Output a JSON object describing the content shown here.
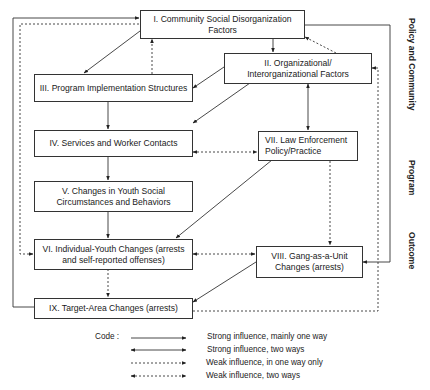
{
  "diagram": {
    "boxes": {
      "I": {
        "label": "I. Community Social Disorganization Factors"
      },
      "II": {
        "label": "II. Organizational/ Interorganizational Factors"
      },
      "III": {
        "label": "III. Program Implementation Structures"
      },
      "IV": {
        "label": "IV. Services and Worker Contacts"
      },
      "V": {
        "label": "V. Changes in Youth Social Circumstances and Behaviors"
      },
      "VI": {
        "label": "VI. Individual-Youth Changes (arrests and self-reported offenses)"
      },
      "VII": {
        "label": "VII. Law Enforcement Policy/Practice"
      },
      "VIII": {
        "label": "VIII. Gang-as-a-Unit Changes (arrests)"
      },
      "IX": {
        "label": "IX. Target-Area Changes (arrests)"
      }
    },
    "side_labels": {
      "policy": "Policy and Community",
      "program": "Program",
      "outcome": "Outcome"
    },
    "connections": [
      {
        "from": "I",
        "to": "III",
        "type": "strong-one-way"
      },
      {
        "from": "III",
        "to": "I",
        "type": "weak-one-way"
      },
      {
        "from": "I",
        "to": "II",
        "type": "strong-one-way"
      },
      {
        "from": "II",
        "to": "I",
        "type": "weak-one-way"
      },
      {
        "from": "II",
        "to": "III",
        "type": "strong-one-way"
      },
      {
        "from": "II",
        "to": "IV",
        "type": "strong-one-way"
      },
      {
        "from": "II",
        "to": "VII",
        "type": "strong-two-ways"
      },
      {
        "from": "III",
        "to": "IV",
        "type": "strong-one-way"
      },
      {
        "from": "IV",
        "to": "VII",
        "type": "weak-two-ways"
      },
      {
        "from": "IV",
        "to": "V",
        "type": "strong-one-way"
      },
      {
        "from": "V",
        "to": "VI",
        "type": "strong-one-way"
      },
      {
        "from": "VII",
        "to": "VI",
        "type": "strong-one-way"
      },
      {
        "from": "VII",
        "to": "VIII",
        "type": "weak-one-way"
      },
      {
        "from": "VI",
        "to": "VIII",
        "type": "weak-two-ways"
      },
      {
        "from": "VI",
        "to": "IX",
        "type": "weak-one-way"
      },
      {
        "from": "VIII",
        "to": "IX",
        "type": "strong-one-way"
      },
      {
        "from": "I",
        "to": "VI",
        "type": "weak-one-way"
      },
      {
        "from": "IX",
        "to": "I",
        "type": "strong-one-way"
      },
      {
        "from": "I",
        "to": "VIII",
        "type": "strong-one-way"
      },
      {
        "from": "IX",
        "to": "II",
        "type": "weak-one-way"
      },
      {
        "from": "VIII",
        "to": "VI",
        "type": "weak-one-way"
      }
    ],
    "legend": {
      "title": "Code :",
      "items": [
        {
          "style": "strong-one-way",
          "label": "Strong influence, mainly one way"
        },
        {
          "style": "strong-two-ways",
          "label": "Strong influence, two ways"
        },
        {
          "style": "weak-one-way",
          "label": "Weak influence, in one way only"
        },
        {
          "style": "weak-two-ways",
          "label": "Weak influence, two ways"
        }
      ]
    },
    "colors": {
      "line": "#333333",
      "background": "#ffffff"
    }
  }
}
